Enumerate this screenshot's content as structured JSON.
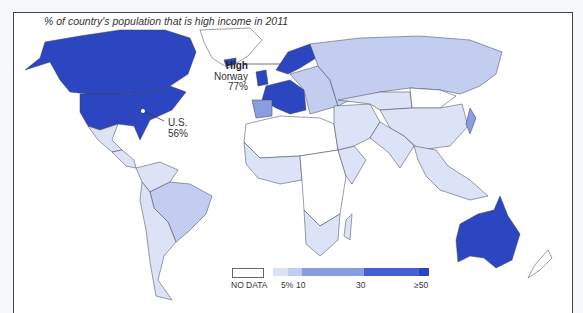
{
  "title": "% of country's population that is high income in 2011",
  "colors": {
    "no_data": "#ffffff",
    "bin_0_5": "#dde3f6",
    "bin_5_10": "#c3cdef",
    "bin_10_30": "#8a9de0",
    "bin_30_50": "#4660cf",
    "bin_50_plus": "#2c45c0",
    "border": "#3a3f55"
  },
  "annotations": {
    "high": {
      "header": "High",
      "country": "Norway",
      "value": "77%"
    },
    "us": {
      "country": "U.S.",
      "value": "56%"
    }
  },
  "legend": {
    "no_data_label": "NO DATA",
    "ticks": [
      "5%",
      "10",
      "30",
      "≥50"
    ]
  },
  "regions": [
    {
      "name": "Canada",
      "bin": "bin_50_plus"
    },
    {
      "name": "United States",
      "bin": "bin_50_plus"
    },
    {
      "name": "Greenland",
      "bin": "no_data"
    },
    {
      "name": "Mexico",
      "bin": "bin_0_5"
    },
    {
      "name": "Central America",
      "bin": "bin_0_5"
    },
    {
      "name": "Northern South America",
      "bin": "bin_0_5"
    },
    {
      "name": "Brazil",
      "bin": "bin_5_10"
    },
    {
      "name": "Southern South America",
      "bin": "bin_0_5"
    },
    {
      "name": "Iceland",
      "bin": "bin_50_plus"
    },
    {
      "name": "Norway",
      "bin": "bin_50_plus"
    },
    {
      "name": "United Kingdom",
      "bin": "bin_50_plus"
    },
    {
      "name": "Western Europe",
      "bin": "bin_50_plus"
    },
    {
      "name": "Spain",
      "bin": "bin_10_30"
    },
    {
      "name": "Eastern Europe",
      "bin": "bin_5_10"
    },
    {
      "name": "Russia",
      "bin": "bin_5_10"
    },
    {
      "name": "North Africa",
      "bin": "no_data"
    },
    {
      "name": "West Africa",
      "bin": "bin_0_5"
    },
    {
      "name": "Central Africa",
      "bin": "no_data"
    },
    {
      "name": "East Africa",
      "bin": "bin_0_5"
    },
    {
      "name": "Southern Africa",
      "bin": "bin_0_5"
    },
    {
      "name": "Madagascar",
      "bin": "bin_0_5"
    },
    {
      "name": "Middle East",
      "bin": "bin_0_5"
    },
    {
      "name": "Central Asia",
      "bin": "bin_0_5"
    },
    {
      "name": "Mongolia",
      "bin": "no_data"
    },
    {
      "name": "China",
      "bin": "bin_0_5"
    },
    {
      "name": "India",
      "bin": "bin_0_5"
    },
    {
      "name": "Southeast Asia",
      "bin": "bin_0_5"
    },
    {
      "name": "Japan",
      "bin": "bin_10_30"
    },
    {
      "name": "Australia",
      "bin": "bin_50_plus"
    },
    {
      "name": "New Zealand",
      "bin": "no_data"
    }
  ]
}
